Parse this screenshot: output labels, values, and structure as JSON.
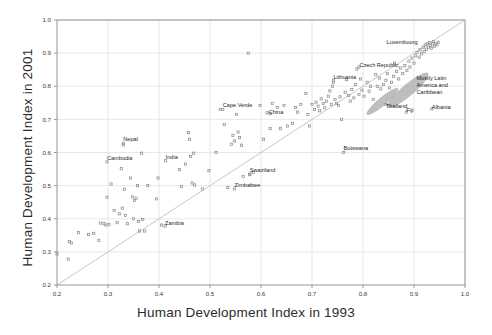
{
  "chart_data": {
    "type": "scatter",
    "title": "",
    "xlabel": "Human Development Index in 1993",
    "ylabel": "Human Development Index in 2001",
    "xlim": [
      0.2,
      1.0
    ],
    "ylim": [
      0.2,
      1.0
    ],
    "xticks": [
      0.2,
      0.3,
      0.4,
      0.5,
      0.6,
      0.7,
      0.8,
      0.9,
      1.0
    ],
    "yticks": [
      0.2,
      0.3,
      0.4,
      0.5,
      0.6,
      0.7,
      0.8,
      0.9,
      1.0
    ],
    "xticklabels": [
      "0.2",
      "0.3",
      "0.4",
      "0.5",
      "0.6",
      "0.7",
      "0.8",
      "0.9",
      "1.0"
    ],
    "yticklabels": [
      "0.2",
      "0.3",
      "0.4",
      "0.5",
      "0.6",
      "0.7",
      "0.8",
      "0.9",
      "1.0"
    ],
    "grid": true,
    "legend": "none",
    "marker": "open-square",
    "marker_color": "#8a8a8a",
    "grid_color": "#d6d6e2",
    "axis_color": "#8c8c8c",
    "reference_line": {
      "name": "y = x identity line",
      "from": [
        0.2,
        0.2
      ],
      "to": [
        1.0,
        1.0
      ],
      "color": "#b9b9b9"
    },
    "annotations": [
      {
        "label": "Luxembourg",
        "x": 0.915,
        "y": 0.928,
        "anchor": "end",
        "dx": -4,
        "dy": 0
      },
      {
        "label": "Czech Republic",
        "x": 0.793,
        "y": 0.859,
        "anchor": "start",
        "dx": 0,
        "dy": 0
      },
      {
        "label": "Lithuania",
        "x": 0.742,
        "y": 0.823,
        "anchor": "start",
        "dx": 0,
        "dy": 0
      },
      {
        "label": "Mostly Latin America and Caribbean",
        "x": 0.905,
        "y": 0.82,
        "anchor": "start",
        "dx": 0,
        "dy": 0,
        "multiline": [
          "Mostly Latin",
          "America and",
          "Caribbean"
        ]
      },
      {
        "label": "Cape Verde",
        "x": 0.525,
        "y": 0.737,
        "anchor": "start",
        "dx": 0,
        "dy": 0
      },
      {
        "label": "China",
        "x": 0.615,
        "y": 0.717,
        "anchor": "start",
        "dx": 0,
        "dy": 0
      },
      {
        "label": "Thailand",
        "x": 0.845,
        "y": 0.733,
        "anchor": "start",
        "dx": 0,
        "dy": 0
      },
      {
        "label": "Fiji",
        "x": 0.885,
        "y": 0.722,
        "anchor": "start",
        "dx": 0,
        "dy": 0
      },
      {
        "label": "Albania",
        "x": 0.935,
        "y": 0.732,
        "anchor": "start",
        "dx": 0,
        "dy": 0
      },
      {
        "label": "Nepal",
        "x": 0.33,
        "y": 0.634,
        "anchor": "start",
        "dx": 0,
        "dy": 0
      },
      {
        "label": "Botswana",
        "x": 0.762,
        "y": 0.608,
        "anchor": "start",
        "dx": 0,
        "dy": 0
      },
      {
        "label": "Cambodia",
        "x": 0.298,
        "y": 0.578,
        "anchor": "start",
        "dx": 0,
        "dy": 0
      },
      {
        "label": "India",
        "x": 0.413,
        "y": 0.58,
        "anchor": "start",
        "dx": 0,
        "dy": 0
      },
      {
        "label": "Swaziland",
        "x": 0.578,
        "y": 0.542,
        "anchor": "start",
        "dx": 0,
        "dy": 0
      },
      {
        "label": "Zimbabwe",
        "x": 0.548,
        "y": 0.497,
        "anchor": "start",
        "dx": 0,
        "dy": 0
      },
      {
        "label": "Zambia",
        "x": 0.412,
        "y": 0.38,
        "anchor": "start",
        "dx": 0,
        "dy": 0
      }
    ],
    "clusters": [
      {
        "name": "thailand-fiji-cluster",
        "cx": 0.838,
        "cy": 0.754,
        "rx": 0.04,
        "ry": 0.013,
        "angle": -40,
        "fill": "#a8a8a8"
      },
      {
        "name": "latin-america-caribbean-cluster",
        "cx": 0.888,
        "cy": 0.788,
        "rx": 0.052,
        "ry": 0.018,
        "angle": -40,
        "fill": "#a8a8a8"
      }
    ],
    "points": [
      [
        0.2,
        0.294
      ],
      [
        0.222,
        0.278
      ],
      [
        0.224,
        0.331
      ],
      [
        0.228,
        0.327
      ],
      [
        0.242,
        0.358
      ],
      [
        0.262,
        0.352
      ],
      [
        0.272,
        0.356
      ],
      [
        0.282,
        0.335
      ],
      [
        0.285,
        0.387
      ],
      [
        0.292,
        0.385
      ],
      [
        0.296,
        0.381
      ],
      [
        0.298,
        0.465
      ],
      [
        0.302,
        0.383
      ],
      [
        0.306,
        0.505
      ],
      [
        0.312,
        0.425
      ],
      [
        0.318,
        0.388
      ],
      [
        0.322,
        0.415
      ],
      [
        0.326,
        0.551
      ],
      [
        0.328,
        0.432
      ],
      [
        0.33,
        0.623
      ],
      [
        0.332,
        0.489
      ],
      [
        0.334,
        0.41
      ],
      [
        0.338,
        0.385
      ],
      [
        0.344,
        0.523
      ],
      [
        0.348,
        0.466
      ],
      [
        0.35,
        0.4
      ],
      [
        0.352,
        0.455
      ],
      [
        0.355,
        0.462
      ],
      [
        0.358,
        0.5
      ],
      [
        0.36,
        0.392
      ],
      [
        0.362,
        0.363
      ],
      [
        0.366,
        0.598
      ],
      [
        0.368,
        0.398
      ],
      [
        0.372,
        0.363
      ],
      [
        0.378,
        0.5
      ],
      [
        0.395,
        0.46
      ],
      [
        0.398,
        0.523
      ],
      [
        0.405,
        0.381
      ],
      [
        0.44,
        0.548
      ],
      [
        0.444,
        0.497
      ],
      [
        0.452,
        0.565
      ],
      [
        0.458,
        0.66
      ],
      [
        0.46,
        0.64
      ],
      [
        0.462,
        0.588
      ],
      [
        0.465,
        0.508
      ],
      [
        0.468,
        0.598
      ],
      [
        0.47,
        0.502
      ],
      [
        0.485,
        0.49
      ],
      [
        0.498,
        0.545
      ],
      [
        0.512,
        0.6
      ],
      [
        0.52,
        0.73
      ],
      [
        0.528,
        0.684
      ],
      [
        0.535,
        0.494
      ],
      [
        0.542,
        0.625
      ],
      [
        0.545,
        0.652
      ],
      [
        0.548,
        0.635
      ],
      [
        0.552,
        0.715
      ],
      [
        0.555,
        0.662
      ],
      [
        0.558,
        0.645
      ],
      [
        0.562,
        0.622
      ],
      [
        0.565,
        0.528
      ],
      [
        0.578,
        0.533
      ],
      [
        0.585,
        0.54
      ],
      [
        0.598,
        0.742
      ],
      [
        0.605,
        0.64
      ],
      [
        0.612,
        0.72
      ],
      [
        0.618,
        0.672
      ],
      [
        0.622,
        0.748
      ],
      [
        0.632,
        0.736
      ],
      [
        0.638,
        0.672
      ],
      [
        0.645,
        0.742
      ],
      [
        0.652,
        0.68
      ],
      [
        0.662,
        0.688
      ],
      [
        0.668,
        0.736
      ],
      [
        0.672,
        0.722
      ],
      [
        0.678,
        0.745
      ],
      [
        0.688,
        0.778
      ],
      [
        0.692,
        0.715
      ],
      [
        0.695,
        0.68
      ],
      [
        0.7,
        0.745
      ],
      [
        0.705,
        0.73
      ],
      [
        0.708,
        0.752
      ],
      [
        0.712,
        0.74
      ],
      [
        0.715,
        0.726
      ],
      [
        0.718,
        0.762
      ],
      [
        0.722,
        0.748
      ],
      [
        0.725,
        0.735
      ],
      [
        0.728,
        0.755
      ],
      [
        0.732,
        0.77
      ],
      [
        0.735,
        0.786
      ],
      [
        0.738,
        0.745
      ],
      [
        0.74,
        0.8
      ],
      [
        0.742,
        0.812
      ],
      [
        0.745,
        0.76
      ],
      [
        0.748,
        0.748
      ],
      [
        0.752,
        0.742
      ],
      [
        0.755,
        0.768
      ],
      [
        0.758,
        0.7
      ],
      [
        0.762,
        0.6
      ],
      [
        0.765,
        0.782
      ],
      [
        0.768,
        0.82
      ],
      [
        0.772,
        0.772
      ],
      [
        0.775,
        0.755
      ],
      [
        0.778,
        0.79
      ],
      [
        0.782,
        0.765
      ],
      [
        0.785,
        0.805
      ],
      [
        0.788,
        0.852
      ],
      [
        0.792,
        0.775
      ],
      [
        0.795,
        0.822
      ],
      [
        0.798,
        0.788
      ],
      [
        0.802,
        0.77
      ],
      [
        0.808,
        0.812
      ],
      [
        0.812,
        0.785
      ],
      [
        0.815,
        0.8
      ],
      [
        0.82,
        0.76
      ],
      [
        0.825,
        0.835
      ],
      [
        0.828,
        0.8
      ],
      [
        0.832,
        0.825
      ],
      [
        0.835,
        0.792
      ],
      [
        0.84,
        0.805
      ],
      [
        0.845,
        0.818
      ],
      [
        0.848,
        0.838
      ],
      [
        0.852,
        0.795
      ],
      [
        0.856,
        0.812
      ],
      [
        0.86,
        0.83
      ],
      [
        0.862,
        0.87
      ],
      [
        0.866,
        0.845
      ],
      [
        0.87,
        0.822
      ],
      [
        0.874,
        0.855
      ],
      [
        0.878,
        0.838
      ],
      [
        0.882,
        0.862
      ],
      [
        0.886,
        0.848
      ],
      [
        0.89,
        0.876
      ],
      [
        0.892,
        0.858
      ],
      [
        0.896,
        0.885
      ],
      [
        0.9,
        0.87
      ],
      [
        0.903,
        0.892
      ],
      [
        0.906,
        0.902
      ],
      [
        0.91,
        0.888
      ],
      [
        0.912,
        0.91
      ],
      [
        0.915,
        0.898
      ],
      [
        0.918,
        0.918
      ],
      [
        0.92,
        0.905
      ],
      [
        0.922,
        0.925
      ],
      [
        0.924,
        0.912
      ],
      [
        0.926,
        0.928
      ],
      [
        0.928,
        0.918
      ],
      [
        0.93,
        0.932
      ],
      [
        0.932,
        0.922
      ],
      [
        0.934,
        0.915
      ],
      [
        0.936,
        0.928
      ],
      [
        0.938,
        0.935
      ],
      [
        0.94,
        0.92
      ],
      [
        0.942,
        0.93
      ],
      [
        0.945,
        0.925
      ],
      [
        0.948,
        0.933
      ],
      [
        0.935,
        0.732
      ],
      [
        0.618,
        0.717
      ],
      [
        0.525,
        0.73
      ],
      [
        0.885,
        0.722
      ],
      [
        0.845,
        0.745
      ],
      [
        0.548,
        0.49
      ],
      [
        0.578,
        0.535
      ],
      [
        0.412,
        0.378
      ],
      [
        0.33,
        0.628
      ],
      [
        0.298,
        0.572
      ],
      [
        0.413,
        0.575
      ],
      [
        0.792,
        0.858
      ],
      [
        0.742,
        0.818
      ],
      [
        0.575,
        0.9
      ]
    ]
  }
}
